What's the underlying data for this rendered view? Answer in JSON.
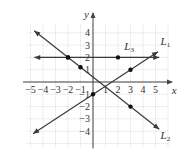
{
  "chart_data": {
    "type": "line",
    "title": "",
    "xlabel": "x",
    "ylabel": "y",
    "xlim": [
      -5.5,
      6
    ],
    "ylim": [
      -5,
      5
    ],
    "grid": true,
    "x_ticks": [
      "−5",
      "−4",
      "−3",
      "−2",
      "−1",
      "1",
      "2",
      "3",
      "4",
      "5"
    ],
    "y_ticks": [
      "4",
      "3",
      "2",
      "1",
      "−1",
      "−2",
      "−3",
      "−4"
    ],
    "series": [
      {
        "name": "L1",
        "label": "L",
        "sub": "1",
        "slope": 0.6667,
        "intercept": -1,
        "points": [
          [
            0,
            -1
          ],
          [
            3,
            1
          ]
        ],
        "range": [
          -4.8,
          5.2
        ]
      },
      {
        "name": "L2",
        "label": "L",
        "sub": "2",
        "slope": -0.8,
        "intercept": 0.4,
        "points": [
          [
            -2,
            2
          ],
          [
            -1,
            1.2
          ],
          [
            3,
            -2
          ]
        ],
        "range": [
          -4.7,
          5.3
        ]
      },
      {
        "name": "L3",
        "label": "L",
        "sub": "3",
        "slope": 0,
        "intercept": 2,
        "points": [
          [
            -2,
            2
          ],
          [
            2,
            2
          ]
        ],
        "range": [
          -4.7,
          5.3
        ]
      }
    ]
  },
  "colors": {
    "line": "#3a3a3a",
    "grid": "#c8c8c8",
    "axis": "#444444",
    "point": "#111111"
  }
}
